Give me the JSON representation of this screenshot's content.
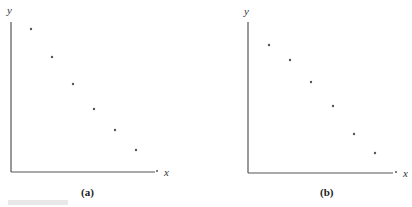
{
  "chart_data": [
    {
      "type": "scatter",
      "panel_label": "(a)",
      "xlabel": "x",
      "ylabel": "y",
      "grid": false,
      "ticks": false,
      "points_px": [
        [
          31,
          29
        ],
        [
          52,
          57
        ],
        [
          73,
          84
        ],
        [
          94,
          109
        ],
        [
          115,
          130
        ],
        [
          136,
          150
        ]
      ],
      "x": [
        1,
        2,
        3,
        4,
        5,
        6
      ],
      "y": [
        0.95,
        0.76,
        0.59,
        0.42,
        0.28,
        0.15
      ],
      "trend": "decreasing, slightly convex"
    },
    {
      "type": "scatter",
      "panel_label": "(b)",
      "xlabel": "x",
      "ylabel": "y",
      "grid": false,
      "ticks": false,
      "points_px": [
        [
          269,
          45
        ],
        [
          290,
          60
        ],
        [
          311,
          82
        ],
        [
          333,
          106
        ],
        [
          354,
          134
        ],
        [
          375,
          153
        ]
      ],
      "x": [
        1,
        2,
        3,
        4,
        5,
        6
      ],
      "y": [
        0.85,
        0.75,
        0.6,
        0.45,
        0.26,
        0.13
      ],
      "trend": "decreasing, slightly concave"
    }
  ],
  "panels": {
    "a": {
      "caption": "(a)",
      "x_label": "x",
      "y_label": "y"
    },
    "b": {
      "caption": "(b)",
      "x_label": "x",
      "y_label": "y"
    }
  },
  "colors": {
    "axis": "#555555",
    "point": "#555555",
    "text": "#222222"
  }
}
